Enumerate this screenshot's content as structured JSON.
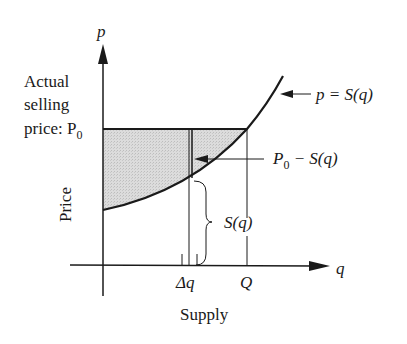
{
  "figure": {
    "type": "producer-surplus-diagram",
    "axes": {
      "y_axis_label": "p",
      "x_axis_label": "q",
      "y_title": "Price",
      "x_title": "Supply"
    },
    "curve_label": "p = S(q)",
    "price_label_lines": [
      "Actual",
      "selling",
      "price: P"
    ],
    "price_label_subscript": "0",
    "difference_label_main": "P",
    "difference_label_sub": "0",
    "difference_label_rest": " − S(q)",
    "strip_height_label": "S(q)",
    "x_ticks": {
      "delta_q": "Δq",
      "Q": "Q"
    },
    "colors": {
      "ink": "#1a1a1a",
      "shade": "#d4d4d4",
      "background": "#ffffff"
    }
  }
}
